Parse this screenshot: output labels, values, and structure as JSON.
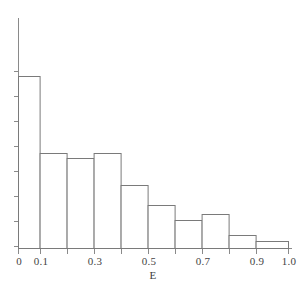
{
  "chart_data": {
    "type": "bar",
    "title": "",
    "subtitle": "",
    "xlabel": "E",
    "ylabel": "",
    "legend": [],
    "grid": false,
    "xlim": [
      0,
      1.0
    ],
    "ylim": [
      0,
      1.0
    ],
    "xticks": [
      0,
      0.05,
      0.1,
      0.2,
      0.3,
      0.4,
      0.5,
      0.6,
      0.7,
      0.8,
      0.9,
      1.0
    ],
    "xtick_labels": [
      "0",
      "0.1",
      "0.3",
      "0.5",
      "0.7",
      "0.9",
      "1.0"
    ],
    "xtick_label_positions": [
      0,
      0.1,
      0.3,
      0.5,
      0.7,
      0.9,
      1.0
    ],
    "ytick_count": 8,
    "ytick_labels": [],
    "bin_edges": [
      0.0,
      0.08,
      0.18,
      0.28,
      0.38,
      0.48,
      0.58,
      0.68,
      0.78,
      0.88,
      1.0
    ],
    "categories": [
      "0.00-0.08",
      "0.08-0.18",
      "0.18-0.28",
      "0.28-0.38",
      "0.38-0.48",
      "0.48-0.58",
      "0.58-0.68",
      "0.68-0.78",
      "0.78-0.88",
      "0.88-1.00"
    ],
    "values": [
      0.748,
      0.413,
      0.391,
      0.413,
      0.274,
      0.187,
      0.122,
      0.148,
      0.057,
      0.03
    ],
    "bar_top_px": [
      76,
      153,
      158,
      153,
      185,
      205,
      220,
      214,
      235,
      241
    ],
    "baseline_px": 248,
    "bar_fill": "#ffffff",
    "bar_edge_color": "#7a7a7a",
    "axis_color": "#8a8a8a",
    "text_color": "#3d3d3d",
    "background": "#ffffff"
  },
  "figure": {
    "xlabel": "E",
    "tick_labels": {
      "t0": "0",
      "t1": "0.1",
      "t2": "0.3",
      "t3": "0.5",
      "t4": "0.7",
      "t5": "0.9",
      "t6": "1.0"
    }
  }
}
